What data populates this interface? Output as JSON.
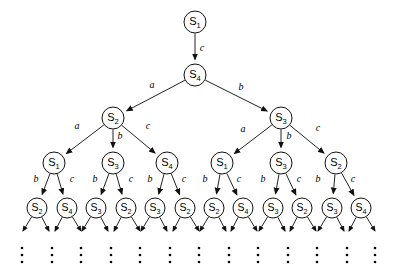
{
  "figure": {
    "alphabet": [
      "a",
      "b",
      "c"
    ],
    "state_names": [
      "S1",
      "S2",
      "S3",
      "S4"
    ],
    "node_prefix": "S",
    "colors": {
      "background": "#ffffff",
      "stroke": "#222222",
      "node_fill": "#ffffff",
      "node_stroke": "#111111",
      "text": "#000000"
    },
    "geometry": {
      "node_radius": 11,
      "leaf_radius": 10,
      "level_y": [
        22,
        75,
        118,
        163,
        208
      ],
      "ellipsis_y": 248
    }
  },
  "levels": [
    {
      "index": 0,
      "nodes": [
        {
          "id": "n0",
          "label": "S",
          "sub": "1",
          "x": 195,
          "y": 22,
          "r": 11
        }
      ]
    },
    {
      "index": 1,
      "nodes": [
        {
          "id": "n1",
          "label": "S",
          "sub": "4",
          "x": 195,
          "y": 75,
          "r": 11
        }
      ]
    },
    {
      "index": 2,
      "nodes": [
        {
          "id": "n2",
          "label": "S",
          "sub": "2",
          "x": 113,
          "y": 118,
          "r": 11
        },
        {
          "id": "n3",
          "label": "S",
          "sub": "3",
          "x": 281,
          "y": 118,
          "r": 11
        }
      ]
    },
    {
      "index": 3,
      "nodes": [
        {
          "id": "n4",
          "label": "S",
          "sub": "1",
          "x": 54,
          "y": 163,
          "r": 11
        },
        {
          "id": "n5",
          "label": "S",
          "sub": "3",
          "x": 113,
          "y": 163,
          "r": 11
        },
        {
          "id": "n6",
          "label": "S",
          "sub": "4",
          "x": 167,
          "y": 163,
          "r": 11
        },
        {
          "id": "n7",
          "label": "S",
          "sub": "1",
          "x": 222,
          "y": 163,
          "r": 11
        },
        {
          "id": "n8",
          "label": "S",
          "sub": "3",
          "x": 281,
          "y": 163,
          "r": 11
        },
        {
          "id": "n9",
          "label": "S",
          "sub": "2",
          "x": 336,
          "y": 163,
          "r": 11
        }
      ]
    },
    {
      "index": 4,
      "nodes": [
        {
          "id": "l0",
          "label": "S",
          "sub": "2",
          "x": 37,
          "y": 208,
          "r": 10
        },
        {
          "id": "l1",
          "label": "S",
          "sub": "4",
          "x": 67,
          "y": 208,
          "r": 10
        },
        {
          "id": "l2",
          "label": "S",
          "sub": "3",
          "x": 96,
          "y": 208,
          "r": 10
        },
        {
          "id": "l3",
          "label": "S",
          "sub": "2",
          "x": 126,
          "y": 208,
          "r": 10
        },
        {
          "id": "l4",
          "label": "S",
          "sub": "3",
          "x": 155,
          "y": 208,
          "r": 10
        },
        {
          "id": "l5",
          "label": "S",
          "sub": "2",
          "x": 185,
          "y": 208,
          "r": 10
        },
        {
          "id": "l6",
          "label": "S",
          "sub": "2",
          "x": 214,
          "y": 208,
          "r": 10
        },
        {
          "id": "l7",
          "label": "S",
          "sub": "4",
          "x": 243,
          "y": 208,
          "r": 10
        },
        {
          "id": "l8",
          "label": "S",
          "sub": "3",
          "x": 273,
          "y": 208,
          "r": 10
        },
        {
          "id": "l9",
          "label": "S",
          "sub": "2",
          "x": 302,
          "y": 208,
          "r": 10
        },
        {
          "id": "l10",
          "label": "S",
          "sub": "3",
          "x": 332,
          "y": 208,
          "r": 10
        },
        {
          "id": "l11",
          "label": "S",
          "sub": "4",
          "x": 361,
          "y": 208,
          "r": 10
        }
      ]
    }
  ],
  "edges": [
    {
      "from": "n0",
      "to": "n1",
      "label": "c",
      "lx": 202,
      "ly": 49
    },
    {
      "from": "n1",
      "to": "n2",
      "label": "a",
      "lx": 152,
      "ly": 86
    },
    {
      "from": "n1",
      "to": "n3",
      "label": "b",
      "lx": 241,
      "ly": 88
    },
    {
      "from": "n2",
      "to": "n4",
      "label": "a",
      "lx": 77,
      "ly": 127
    },
    {
      "from": "n2",
      "to": "n5",
      "label": "b",
      "lx": 120,
      "ly": 137
    },
    {
      "from": "n2",
      "to": "n6",
      "label": "c",
      "lx": 148,
      "ly": 127
    },
    {
      "from": "n3",
      "to": "n7",
      "label": "a",
      "lx": 243,
      "ly": 130
    },
    {
      "from": "n3",
      "to": "n8",
      "label": "b",
      "lx": 289,
      "ly": 137
    },
    {
      "from": "n3",
      "to": "n9",
      "label": "c",
      "lx": 318,
      "ly": 129
    },
    {
      "from": "n4",
      "to": "l0",
      "label": "b",
      "lx": 36,
      "ly": 180
    },
    {
      "from": "n4",
      "to": "l1",
      "label": "c",
      "lx": 72,
      "ly": 180
    },
    {
      "from": "n5",
      "to": "l2",
      "label": "b",
      "lx": 95,
      "ly": 180
    },
    {
      "from": "n5",
      "to": "l3",
      "label": "c",
      "lx": 131,
      "ly": 180
    },
    {
      "from": "n6",
      "to": "l4",
      "label": "b",
      "lx": 150,
      "ly": 180
    },
    {
      "from": "n6",
      "to": "l5",
      "label": "c",
      "lx": 184,
      "ly": 180
    },
    {
      "from": "n7",
      "to": "l6",
      "label": "b",
      "lx": 205,
      "ly": 180
    },
    {
      "from": "n7",
      "to": "l7",
      "label": "c",
      "lx": 239,
      "ly": 180
    },
    {
      "from": "n8",
      "to": "l8",
      "label": "b",
      "lx": 263,
      "ly": 180
    },
    {
      "from": "n8",
      "to": "l9",
      "label": "c",
      "lx": 299,
      "ly": 180
    },
    {
      "from": "n9",
      "to": "l10",
      "label": "b",
      "lx": 318,
      "ly": 180
    },
    {
      "from": "n9",
      "to": "l11",
      "label": "c",
      "lx": 353,
      "ly": 180
    }
  ],
  "leaf_stubs": [
    {
      "from": "l0",
      "dx": -14
    },
    {
      "from": "l0",
      "dx": 12
    },
    {
      "from": "l1",
      "dx": -12
    },
    {
      "from": "l1",
      "dx": 14
    },
    {
      "from": "l2",
      "dx": -14
    },
    {
      "from": "l2",
      "dx": 12
    },
    {
      "from": "l3",
      "dx": -12
    },
    {
      "from": "l3",
      "dx": 14
    },
    {
      "from": "l4",
      "dx": -14
    },
    {
      "from": "l4",
      "dx": 12
    },
    {
      "from": "l5",
      "dx": -12
    },
    {
      "from": "l5",
      "dx": 14
    },
    {
      "from": "l6",
      "dx": -14
    },
    {
      "from": "l6",
      "dx": 12
    },
    {
      "from": "l7",
      "dx": -12
    },
    {
      "from": "l7",
      "dx": 14
    },
    {
      "from": "l8",
      "dx": -14
    },
    {
      "from": "l8",
      "dx": 12
    },
    {
      "from": "l9",
      "dx": -12
    },
    {
      "from": "l9",
      "dx": 14
    },
    {
      "from": "l10",
      "dx": -14
    },
    {
      "from": "l10",
      "dx": 12
    },
    {
      "from": "l11",
      "dx": -12
    },
    {
      "from": "l11",
      "dx": 14
    }
  ],
  "ellipses": [
    {
      "x": 22
    },
    {
      "x": 52
    },
    {
      "x": 81
    },
    {
      "x": 111
    },
    {
      "x": 140
    },
    {
      "x": 170
    },
    {
      "x": 199
    },
    {
      "x": 229
    },
    {
      "x": 258
    },
    {
      "x": 288
    },
    {
      "x": 317
    },
    {
      "x": 347
    },
    {
      "x": 375
    }
  ]
}
